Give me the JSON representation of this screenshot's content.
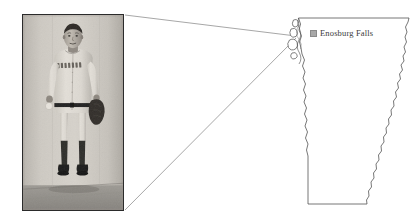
{
  "figure": {
    "background_color": "#ffffff",
    "width": 418,
    "height": 224,
    "alt": "Historical black and white photograph of a baseball player in a BOSTON uniform, connected by callout lines to a location marked on an outline map of Vermont."
  },
  "photo": {
    "name": "baseball-player-photograph",
    "caption": "Black and white photograph of a baseball player standing against a wall",
    "uniform_text": "BOSTON",
    "frame_color": "#2b2b2b",
    "tone_light": "#d8d5cf",
    "tone_mid": "#b3afa8",
    "tone_dark": "#2e2c2a",
    "subject": {
      "pose": "standing, facing camera",
      "holds_ball_hand": "left",
      "holds_glove_hand": "right",
      "socks": "dark",
      "shoes": "dark"
    }
  },
  "map": {
    "name": "vermont-outline-map",
    "state": "Vermont",
    "outline_color": "#4a4a4a",
    "fill_color": "#ffffff",
    "features": [
      "Connecticut River eastern border",
      "Lake Champlain islands northwest",
      "Straight southern border",
      "Straight northern border"
    ]
  },
  "city_label": {
    "name": "Enosburg Falls",
    "marker_icon": "map-marker-square-icon",
    "marker_color": "#a8a8a8",
    "text_color": "#3a3a3a"
  },
  "leader_lines": {
    "color": "#6b6b6b",
    "count": 2,
    "description": "Two thin lines connecting the photograph frame corners to the marked map location"
  }
}
